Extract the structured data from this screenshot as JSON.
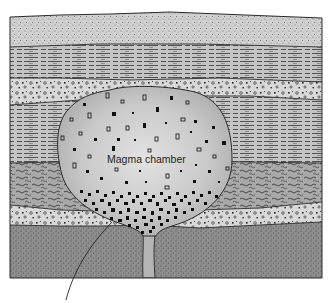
{
  "figure": {
    "labels": {
      "magma_chamber": "Magma chamber"
    },
    "colors": {
      "background": "#ffffff",
      "outline": "#2a2a2a",
      "stipple_top": "#d2d2d2",
      "lined_layer": "#c4c4c4",
      "pebble_layer": "#d8d8d8",
      "wavy_layer": "#a9a9a9",
      "bottom_layer": "#8e8e8e",
      "magma_light": "#d6d6d6",
      "magma_dark": "#b0b0b0",
      "crystal": "#111111",
      "conduit": "#b4b4b4"
    },
    "layers": [
      {
        "name": "stippled-sandstone-layer",
        "pattern": "fine-stipple"
      },
      {
        "name": "lined-shale-layer-upper",
        "pattern": "horizontal-dashes"
      },
      {
        "name": "pebble-conglomerate-layer-upper",
        "pattern": "pebbles"
      },
      {
        "name": "lined-shale-layer-lower",
        "pattern": "horizontal-dashes"
      },
      {
        "name": "wavy-schist-layer",
        "pattern": "wavy-lines"
      },
      {
        "name": "pebble-conglomerate-layer-lower",
        "pattern": "pebbles"
      },
      {
        "name": "dark-stippled-basement-layer",
        "pattern": "dense-stipple"
      }
    ]
  }
}
